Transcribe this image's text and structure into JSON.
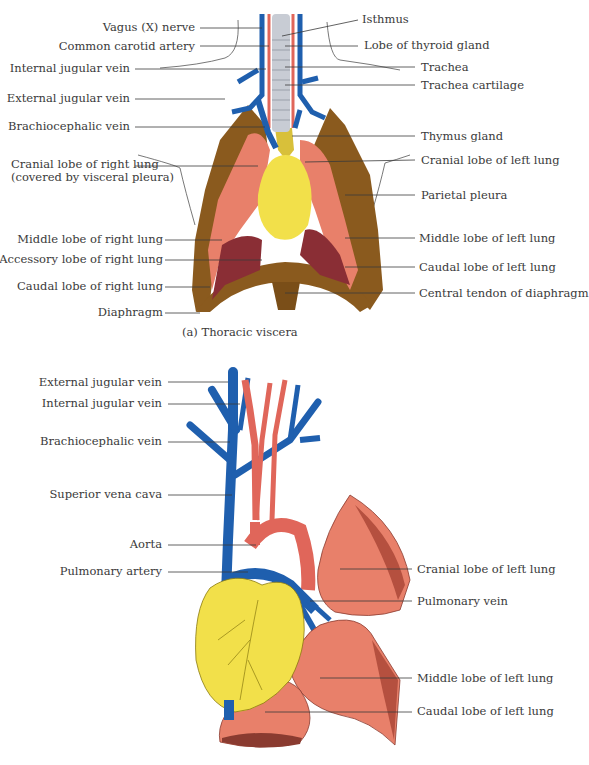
{
  "panel_a": {
    "caption": "(a) Thoracic viscera",
    "labels_left": [
      {
        "id": "vagus-nerve",
        "text": "Vagus (X) nerve"
      },
      {
        "id": "common-carotid-artery",
        "text": "Common carotid artery"
      },
      {
        "id": "internal-jugular-vein",
        "text": "Internal jugular vein"
      },
      {
        "id": "external-jugular-vein",
        "text": "External jugular vein"
      },
      {
        "id": "brachiocephalic-vein",
        "text": "Brachiocephalic vein"
      },
      {
        "id": "cranial-lobe-right-lung",
        "text": "Cranial lobe of right lung",
        "text2": "(covered by visceral pleura)"
      },
      {
        "id": "middle-lobe-right-lung",
        "text": "Middle lobe of right lung"
      },
      {
        "id": "accessory-lobe-right-lung",
        "text": "Accessory lobe of right lung"
      },
      {
        "id": "caudal-lobe-right-lung",
        "text": "Caudal lobe of right lung"
      },
      {
        "id": "diaphragm",
        "text": "Diaphragm"
      }
    ],
    "labels_right": [
      {
        "id": "isthmus",
        "text": "Isthmus"
      },
      {
        "id": "lobe-of-thyroid-gland",
        "text": "Lobe of thyroid gland"
      },
      {
        "id": "trachea",
        "text": "Trachea"
      },
      {
        "id": "trachea-cartilage",
        "text": "Trachea cartilage"
      },
      {
        "id": "thymus-gland",
        "text": "Thymus gland"
      },
      {
        "id": "cranial-lobe-left-lung",
        "text": "Cranial lobe of left lung"
      },
      {
        "id": "parietal-pleura",
        "text": "Parietal pleura"
      },
      {
        "id": "middle-lobe-left-lung",
        "text": "Middle lobe of left lung"
      },
      {
        "id": "caudal-lobe-left-lung",
        "text": "Caudal lobe of left lung"
      },
      {
        "id": "central-tendon-diaphragm",
        "text": "Central tendon of diaphragm"
      }
    ]
  },
  "panel_b": {
    "labels_left": [
      {
        "id": "external-jugular-vein",
        "text": "External jugular vein"
      },
      {
        "id": "internal-jugular-vein",
        "text": "Internal jugular vein"
      },
      {
        "id": "brachiocephalic-vein",
        "text": "Brachiocephalic vein"
      },
      {
        "id": "superior-vena-cava",
        "text": "Superior vena cava"
      },
      {
        "id": "aorta",
        "text": "Aorta"
      },
      {
        "id": "pulmonary-artery",
        "text": "Pulmonary artery"
      }
    ],
    "labels_right": [
      {
        "id": "cranial-lobe-left-lung",
        "text": "Cranial lobe of left lung"
      },
      {
        "id": "pulmonary-vein",
        "text": "Pulmonary vein"
      },
      {
        "id": "middle-lobe-left-lung",
        "text": "Middle lobe of left lung"
      },
      {
        "id": "caudal-lobe-left-lung",
        "text": "Caudal lobe of left lung"
      }
    ]
  },
  "colors": {
    "vein": "#1f5fae",
    "artery": "#e0665a",
    "lung": "#e8806a",
    "lung_dark": "#8a2e35",
    "heart": "#f2e04a",
    "muscle": "#8a5a1e",
    "trachea": "#c8ccd4",
    "leader": "#3a3a3a"
  }
}
